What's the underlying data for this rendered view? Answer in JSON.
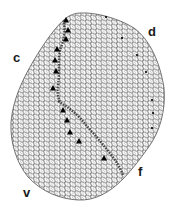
{
  "figure": {
    "labels": {
      "c": "c",
      "d": "d",
      "v": "v",
      "f": "f"
    },
    "equator_markers": {
      "shape": "triangle",
      "count": 12,
      "color": "#000000"
    },
    "edge_dots": {
      "count": 7,
      "color": "#000000"
    },
    "colors": {
      "lattice_stroke": "#2a2a2a",
      "lattice_fill": "#ffffff",
      "equator_band": "#333333",
      "background": "#ffffff"
    }
  }
}
